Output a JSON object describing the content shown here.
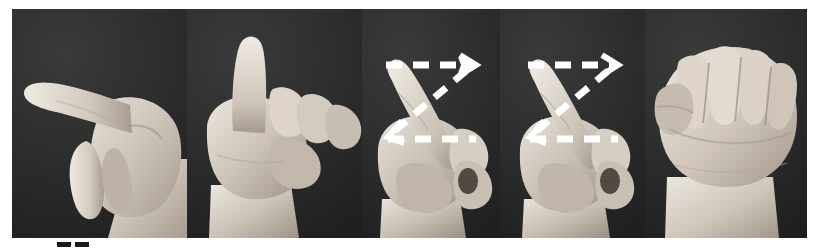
{
  "figure": {
    "background_color": "#ffffff",
    "strip_background_color": "#2e2e2e",
    "overlay_color": "#ffffff",
    "width": 818,
    "height": 250,
    "panel_count": 5
  },
  "panels": [
    {
      "index": 1,
      "name": "panel-index-finger-pointing-left",
      "description": "Hand with index finger extended pointing left, thumb and other fingers curled",
      "has_motion_overlay": false,
      "overlay_label": "",
      "x": 0,
      "width": 175
    },
    {
      "index": 2,
      "name": "panel-index-finger-pointing-up",
      "description": "Hand with index finger extended pointing up, remaining fingers curled into fist",
      "has_motion_overlay": false,
      "overlay_label": "",
      "x": 175,
      "width": 175
    },
    {
      "index": 3,
      "name": "panel-index-finger-diagonal-with-z-path",
      "description": "Hand with index finger extended diagonally, white dashed Z motion path overlaid",
      "has_motion_overlay": true,
      "overlay_label": "Z",
      "x": 350,
      "width": 138
    },
    {
      "index": 4,
      "name": "panel-index-finger-diagonal-with-z-path-repeat",
      "description": "Hand with index finger extended diagonally, white dashed Z motion path overlaid",
      "has_motion_overlay": true,
      "overlay_label": "Z",
      "x": 488,
      "width": 145
    },
    {
      "index": 5,
      "name": "panel-closed-fist",
      "description": "Closed fist, fingers curled, thumb tucked across front",
      "has_motion_overlay": false,
      "overlay_label": "",
      "x": 633,
      "width": 162
    }
  ],
  "motion_overlay": {
    "name": "z-motion-path",
    "stroke_color": "#ffffff",
    "style": "dashed",
    "shape": "z",
    "arrowheads": 2,
    "arrowhead_positions": [
      "top-right",
      "bottom-left"
    ]
  },
  "registration_marks": {
    "name": "registration-marks",
    "count": 2,
    "color": "#1a1a1a"
  }
}
